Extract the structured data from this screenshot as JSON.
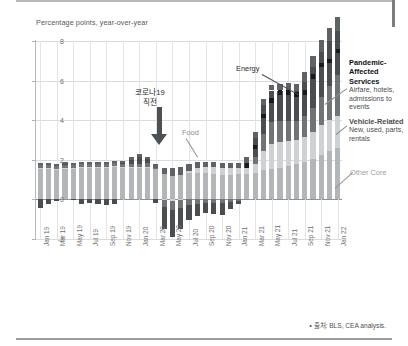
{
  "subtitle": "Percentage points, year-over-year",
  "source": "• 출처: BLS, CEA analysis.",
  "annotations": {
    "covid_line1": "코로나19",
    "covid_line2": "직전",
    "food": "Food",
    "energy": "Energy",
    "other_core": "Other Core",
    "pandemic_title": "Pandemic-Affected",
    "pandemic_title2": "Services",
    "pandemic_sub1": "Airfare, hotels,",
    "pandemic_sub2": "admissions to events",
    "vehicle_title": "Vehicle-Related",
    "vehicle_sub1": "New, used, parts,",
    "vehicle_sub2": "rentals"
  },
  "colors": {
    "other_core": "#b3b6b9",
    "vehicle": "#cfd2d5",
    "pandemic": "#6f7477",
    "energy": "#4a4e51",
    "food": "#5e6366",
    "marker": "#1a1a1a",
    "grid": "#d9dcdf",
    "axis": "#b7babd"
  },
  "chart_data": {
    "type": "bar",
    "title": "",
    "subtitle": "Percentage points, year-over-year",
    "xlabel": "",
    "ylabel": "Percentage points, year-over-year",
    "ylim": [
      -2,
      8
    ],
    "yticks": [
      -2,
      0,
      2,
      4,
      6,
      8
    ],
    "ytick_labels": [
      "-2",
      "0",
      "2",
      "4",
      "6",
      "8"
    ],
    "grid": true,
    "stacked": true,
    "legend_position": "right-annotations",
    "categories": [
      "Jan 19",
      "Feb 19",
      "Mar 19",
      "Apr 19",
      "May 19",
      "Jun 19",
      "Jul 19",
      "Aug 19",
      "Sep 19",
      "Oct 19",
      "Nov 19",
      "Dec 19",
      "Jan 20",
      "Feb 20",
      "Mar 20",
      "Apr 20",
      "May 20",
      "Jun 20",
      "Jul 20",
      "Aug 20",
      "Sep 20",
      "Oct 20",
      "Nov 20",
      "Dec 20",
      "Jan 21",
      "Feb 21",
      "Mar 21",
      "Apr 21",
      "May 21",
      "Jun 21",
      "Jul 21",
      "Aug 21",
      "Sep 21",
      "Oct 21",
      "Nov 21",
      "Dec 21",
      "Jan 22"
    ],
    "xtick_labels": [
      "Jan 19",
      "Mar 19",
      "May 19",
      "Jul 19",
      "Sep 19",
      "Nov 19",
      "Jan 20",
      "Mar 20",
      "May 20",
      "Jul 20",
      "Sep 20",
      "Nov 20",
      "Jan 21",
      "Mar 21",
      "May 21",
      "Jul 21",
      "Sep 21",
      "Nov 21",
      "Jan 22"
    ],
    "series": [
      {
        "name": "Other Core",
        "color": "#b3b6b9",
        "values": [
          1.55,
          1.55,
          1.5,
          1.55,
          1.55,
          1.6,
          1.6,
          1.6,
          1.6,
          1.65,
          1.6,
          1.6,
          1.6,
          1.6,
          1.55,
          1.3,
          1.2,
          1.25,
          1.35,
          1.35,
          1.35,
          1.3,
          1.25,
          1.25,
          1.3,
          1.3,
          1.35,
          1.5,
          1.55,
          1.6,
          1.7,
          1.8,
          1.9,
          2.05,
          2.25,
          2.45,
          2.6
        ]
      },
      {
        "name": "Vehicle-Related",
        "color": "#cfd2d5",
        "values": [
          0.05,
          0.05,
          0.05,
          0.05,
          0.05,
          0.05,
          0.05,
          0.05,
          0.05,
          0.05,
          0.05,
          0.05,
          0.05,
          0.05,
          0.0,
          -0.05,
          -0.1,
          -0.05,
          0.1,
          0.25,
          0.3,
          0.35,
          0.35,
          0.35,
          0.3,
          0.3,
          0.45,
          0.95,
          1.25,
          1.3,
          1.25,
          1.2,
          1.25,
          1.35,
          1.5,
          1.55,
          1.6
        ]
      },
      {
        "name": "Pandemic-Affected Services",
        "color": "#6f7477",
        "values": [
          0.12,
          0.12,
          0.12,
          0.12,
          0.12,
          0.12,
          0.12,
          0.12,
          0.15,
          0.15,
          0.15,
          0.15,
          0.15,
          0.18,
          0.05,
          -0.35,
          -0.45,
          -0.4,
          -0.3,
          -0.25,
          -0.2,
          -0.18,
          -0.18,
          -0.15,
          -0.1,
          0.0,
          0.35,
          0.85,
          1.1,
          1.05,
          1.0,
          0.95,
          1.05,
          1.2,
          1.4,
          1.75,
          2.1
        ]
      },
      {
        "name": "Energy",
        "color": "#4a4e51",
        "values": [
          -0.45,
          -0.25,
          -0.1,
          0.05,
          -0.05,
          -0.25,
          -0.2,
          -0.25,
          -0.3,
          -0.25,
          0.05,
          0.2,
          0.35,
          0.2,
          -0.2,
          -1.1,
          -1.35,
          -1.05,
          -0.75,
          -0.6,
          -0.5,
          -0.55,
          -0.6,
          -0.35,
          -0.15,
          0.25,
          0.95,
          1.45,
          1.6,
          1.55,
          1.55,
          1.5,
          1.75,
          2.1,
          2.3,
          2.25,
          2.2
        ]
      },
      {
        "name": "Food",
        "color": "#5e6366",
        "values": [
          0.1,
          0.1,
          0.1,
          0.1,
          0.1,
          0.1,
          0.1,
          0.1,
          0.1,
          0.1,
          0.1,
          0.12,
          0.12,
          0.12,
          0.18,
          0.3,
          0.4,
          0.38,
          0.32,
          0.28,
          0.26,
          0.25,
          0.25,
          0.26,
          0.26,
          0.28,
          0.28,
          0.3,
          0.3,
          0.32,
          0.36,
          0.4,
          0.46,
          0.52,
          0.6,
          0.66,
          0.72
        ]
      }
    ],
    "markers": {
      "name": "total-headline-marker",
      "color": "#1a1a1a",
      "values": [
        null,
        null,
        null,
        null,
        null,
        null,
        null,
        null,
        null,
        null,
        null,
        null,
        null,
        null,
        null,
        null,
        null,
        null,
        null,
        null,
        null,
        null,
        null,
        null,
        null,
        1.7,
        2.65,
        4.2,
        5.0,
        5.4,
        5.4,
        5.3,
        5.4,
        6.2,
        6.8,
        7.0,
        7.5
      ]
    }
  }
}
